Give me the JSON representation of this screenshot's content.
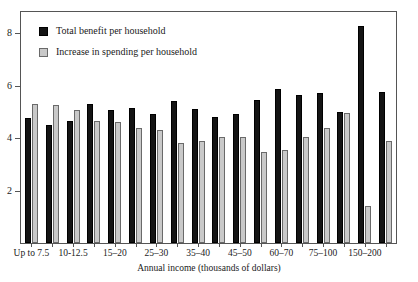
{
  "chart_data": {
    "type": "bar",
    "title": "",
    "subtitle": "",
    "xlabel": "Annual income (thousands of dollars)",
    "ylabel": "",
    "ylim": [
      0,
      8.8
    ],
    "yticks": [
      2,
      4,
      6,
      8
    ],
    "ytick_labels": [
      "2",
      "4",
      "6",
      "8"
    ],
    "grid": false,
    "legend_position": "top-left",
    "categories": [
      "Up to 7.5",
      "7.5-10",
      "10-12.5",
      "12.5-15",
      "15-20",
      "20-25",
      "25-30",
      "30-35",
      "35-40",
      "40-45",
      "45-50",
      "50-60",
      "60-70",
      "70-75",
      "75-100",
      "100-150",
      "150-200",
      "200+"
    ],
    "visible_tick_labels": [
      "Up to 7.5",
      "10-12.5",
      "15–20",
      "25–30",
      "35–40",
      "45–50",
      "60–70",
      "75–100",
      "150–200"
    ],
    "series": [
      {
        "name": "Total benefit per household",
        "color": "#141414",
        "values": [
          4.75,
          4.5,
          4.65,
          5.3,
          5.05,
          5.15,
          4.9,
          5.4,
          5.1,
          4.8,
          4.9,
          5.45,
          5.85,
          5.65,
          5.7,
          5.0,
          8.25,
          5.75
        ]
      },
      {
        "name": "Increase in spending per household",
        "color": "#c9c9c9",
        "values": [
          5.3,
          5.25,
          5.05,
          4.65,
          4.6,
          4.4,
          4.3,
          3.8,
          3.9,
          4.05,
          4.05,
          3.45,
          3.55,
          4.05,
          4.4,
          4.95,
          1.4,
          3.9
        ]
      }
    ]
  },
  "legend": {
    "items": [
      {
        "label": "Total benefit per household",
        "swatch": "dark"
      },
      {
        "label": "Increase in spending per household",
        "swatch": "light"
      }
    ]
  },
  "axis": {
    "x_title": "Annual income (thousands of dollars)"
  }
}
